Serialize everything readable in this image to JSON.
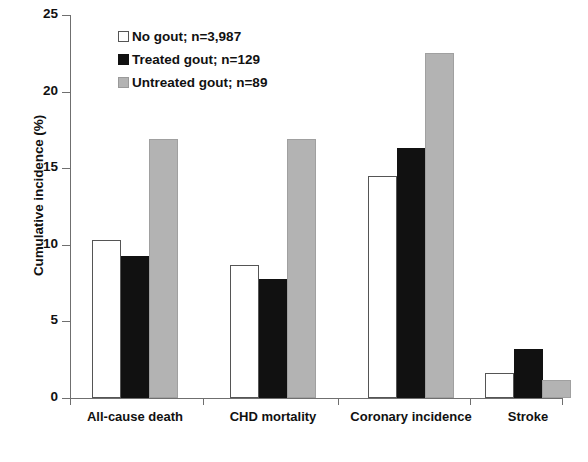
{
  "chart_data": {
    "type": "bar",
    "title": "",
    "xlabel": "",
    "ylabel": "Cumulative incidence (%)",
    "ylim": [
      0,
      25
    ],
    "yticks": [
      0,
      5,
      10,
      15,
      20,
      25
    ],
    "ytick_labels": [
      "0",
      "5",
      "10",
      "15",
      "20",
      "25"
    ],
    "grid": false,
    "legend_position": "top-center",
    "categories": [
      "All-cause death",
      "CHD mortality",
      "Coronary incidence",
      "Stroke"
    ],
    "series": [
      {
        "name": "No gout; n=3,987",
        "short_name": "No gout",
        "n": "3,987",
        "color": "#ffffff",
        "edge_color": "#555555",
        "values": [
          10.3,
          8.7,
          14.5,
          1.6
        ]
      },
      {
        "name": "Treated gout; n=129",
        "short_name": "Treated gout",
        "n": "129",
        "color": "#111111",
        "edge_color": "#111111",
        "values": [
          9.3,
          7.8,
          16.3,
          3.2
        ]
      },
      {
        "name": "Untreated gout; n=89",
        "short_name": "Untreated gout",
        "n": "89",
        "color": "#b3b3b3",
        "edge_color": "#9a9a9a",
        "values": [
          16.9,
          16.9,
          22.5,
          1.2
        ]
      }
    ]
  },
  "axis": {
    "y_title": "Cumulative incidence (%)",
    "tick_0": "0",
    "tick_5": "5",
    "tick_10": "10",
    "tick_15": "15",
    "tick_20": "20",
    "tick_25": "25"
  },
  "legend": {
    "items": [
      {
        "label": "No gout; n=3,987",
        "swatch": "white-square-icon"
      },
      {
        "label": "Treated gout; n=129",
        "swatch": "black-square-icon"
      },
      {
        "label": "Untreated gout; n=89",
        "swatch": "gray-square-icon"
      }
    ]
  },
  "categories": {
    "c0": "All-cause death",
    "c1": "CHD mortality",
    "c2": "Coronary incidence",
    "c3": "Stroke"
  }
}
